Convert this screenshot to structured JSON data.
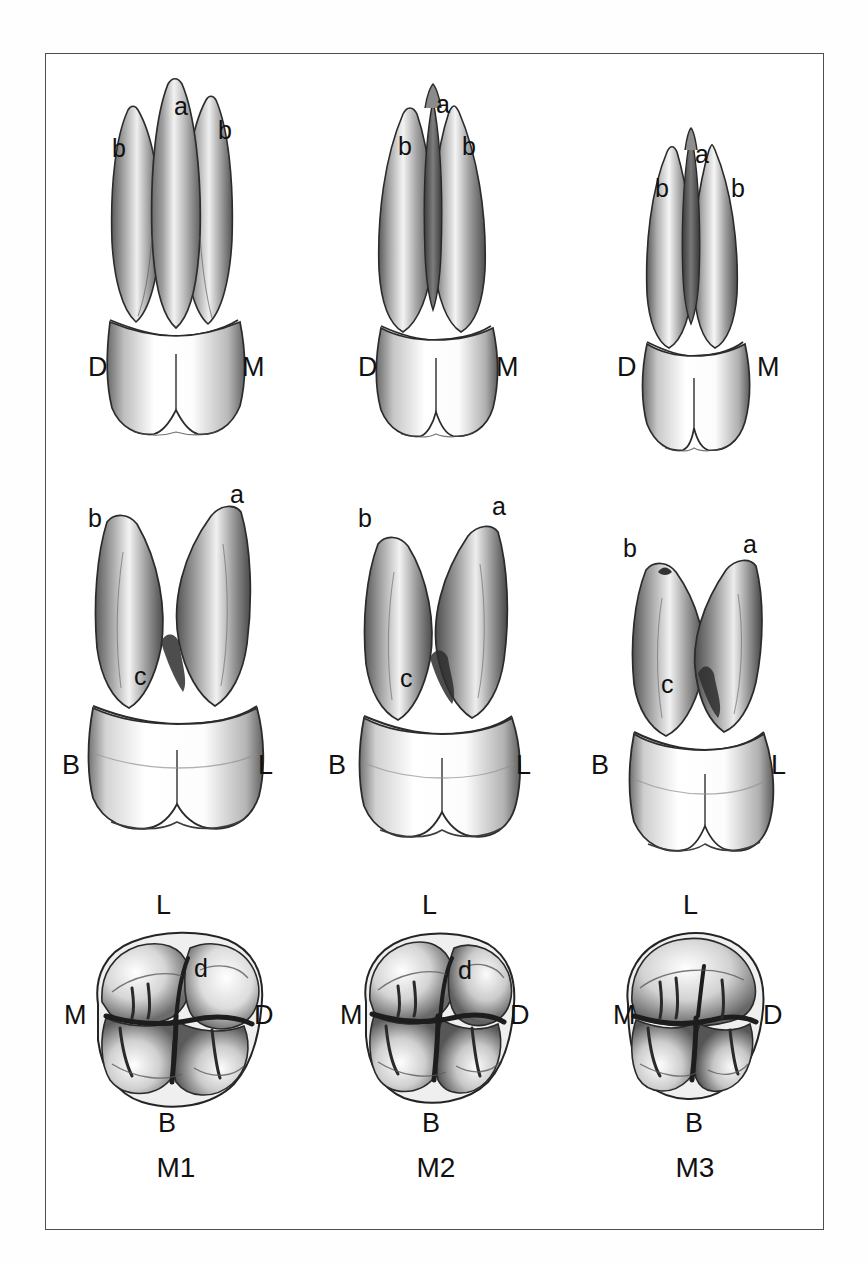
{
  "figure": {
    "kind": "anatomical-illustration",
    "background_color": "#ffffff",
    "frame_color": "#4e4e50",
    "ink_color": "#111111"
  },
  "columns": [
    {
      "id": "M1",
      "caption": "M1"
    },
    {
      "id": "M2",
      "caption": "M2"
    },
    {
      "id": "M3",
      "caption": "M3"
    }
  ],
  "rows": [
    {
      "id": "mesiodistal",
      "view": "proximal view",
      "panels": [
        {
          "column": "M1",
          "cusp_labels": [
            {
              "text": "a",
              "x": 128,
              "y": 30
            },
            {
              "text": "b",
              "x": 66,
              "y": 72
            },
            {
              "text": "b",
              "x": 172,
              "y": 54
            }
          ],
          "orientation_labels": [
            {
              "text": "D",
              "x": 42,
              "y": 290
            },
            {
              "text": "M",
              "x": 196,
              "y": 290
            }
          ]
        },
        {
          "column": "M2",
          "cusp_labels": [
            {
              "text": "a",
              "x": 130,
              "y": 28
            },
            {
              "text": "b",
              "x": 92,
              "y": 70
            },
            {
              "text": "b",
              "x": 156,
              "y": 70
            }
          ],
          "orientation_labels": [
            {
              "text": "D",
              "x": 52,
              "y": 290
            },
            {
              "text": "M",
              "x": 190,
              "y": 290
            }
          ]
        },
        {
          "column": "M3",
          "cusp_labels": [
            {
              "text": "a",
              "x": 130,
              "y": 78
            },
            {
              "text": "b",
              "x": 90,
              "y": 112
            },
            {
              "text": "b",
              "x": 166,
              "y": 112
            }
          ],
          "orientation_labels": [
            {
              "text": "D",
              "x": 52,
              "y": 290
            },
            {
              "text": "M",
              "x": 192,
              "y": 290
            }
          ]
        }
      ]
    },
    {
      "id": "buccolingual",
      "view": "buccal–lingual view",
      "panels": [
        {
          "column": "M1",
          "cusp_labels": [
            {
              "text": "b",
              "x": 42,
              "y": 32
            },
            {
              "text": "a",
              "x": 184,
              "y": 8
            },
            {
              "text": "c",
              "x": 88,
              "y": 190
            }
          ],
          "orientation_labels": [
            {
              "text": "B",
              "x": 16,
              "y": 278
            },
            {
              "text": "L",
              "x": 212,
              "y": 278
            }
          ]
        },
        {
          "column": "M2",
          "cusp_labels": [
            {
              "text": "b",
              "x": 52,
              "y": 32
            },
            {
              "text": "a",
              "x": 186,
              "y": 20
            },
            {
              "text": "c",
              "x": 94,
              "y": 192
            }
          ],
          "orientation_labels": [
            {
              "text": "B",
              "x": 22,
              "y": 278
            },
            {
              "text": "L",
              "x": 210,
              "y": 278
            }
          ]
        },
        {
          "column": "M3",
          "cusp_labels": [
            {
              "text": "b",
              "x": 58,
              "y": 62
            },
            {
              "text": "a",
              "x": 178,
              "y": 58
            },
            {
              "text": "c",
              "x": 96,
              "y": 198
            }
          ],
          "orientation_labels": [
            {
              "text": "B",
              "x": 26,
              "y": 278
            },
            {
              "text": "L",
              "x": 206,
              "y": 278
            }
          ]
        }
      ]
    },
    {
      "id": "occlusal",
      "view": "occlusal view",
      "panels": [
        {
          "column": "M1",
          "cusp_labels": [
            {
              "text": "d",
              "x": 148,
              "y": 82
            }
          ],
          "orientation_labels": [
            {
              "text": "L",
              "x": 110,
              "y": 18
            },
            {
              "text": "M",
              "x": 18,
              "y": 128
            },
            {
              "text": "D",
              "x": 208,
              "y": 128
            },
            {
              "text": "B",
              "x": 112,
              "y": 236
            }
          ]
        },
        {
          "column": "M2",
          "cusp_labels": [
            {
              "text": "d",
              "x": 152,
              "y": 84
            }
          ],
          "orientation_labels": [
            {
              "text": "L",
              "x": 116,
              "y": 18
            },
            {
              "text": "M",
              "x": 34,
              "y": 128
            },
            {
              "text": "D",
              "x": 204,
              "y": 128
            },
            {
              "text": "B",
              "x": 116,
              "y": 236
            }
          ]
        },
        {
          "column": "M3",
          "cusp_labels": [],
          "orientation_labels": [
            {
              "text": "L",
              "x": 118,
              "y": 18
            },
            {
              "text": "M",
              "x": 48,
              "y": 128
            },
            {
              "text": "D",
              "x": 198,
              "y": 128
            },
            {
              "text": "B",
              "x": 120,
              "y": 236
            }
          ]
        }
      ]
    }
  ],
  "legend_keys": {
    "a": "a",
    "b": "b",
    "c": "c",
    "d": "d",
    "D": "D",
    "M": "M",
    "B": "B",
    "L": "L"
  }
}
